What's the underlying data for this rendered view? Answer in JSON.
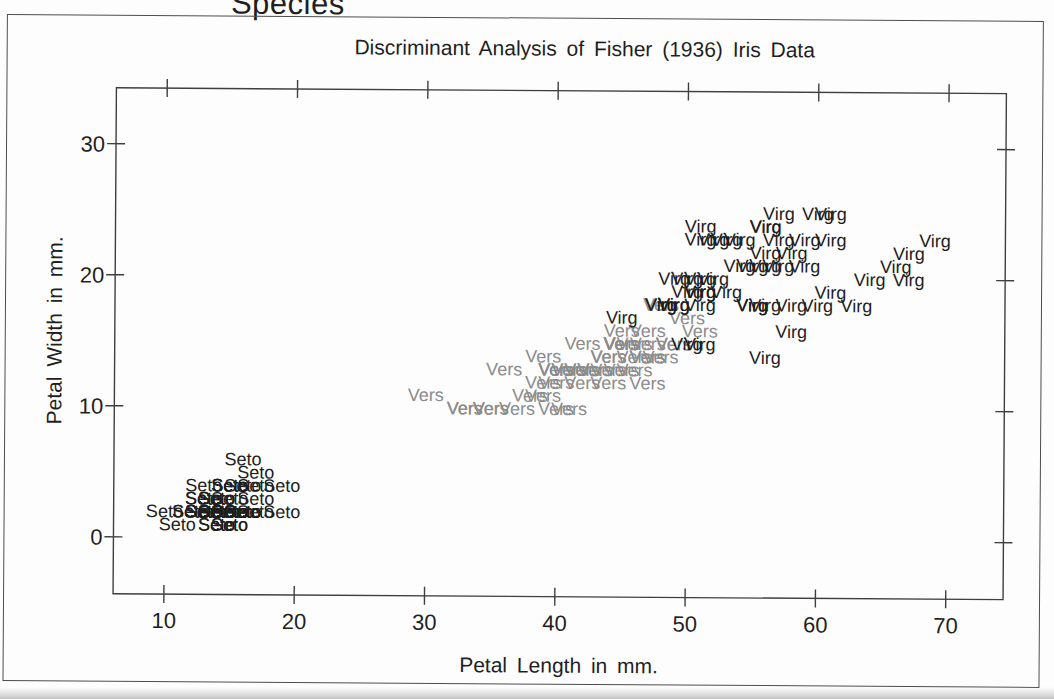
{
  "chart_data": {
    "type": "scatter",
    "title": "Discriminant Analysis of Fisher (1936) Iris Data",
    "legend_title": "Species",
    "xlabel": "Petal Length in mm.",
    "ylabel": "Petal Width in mm.",
    "xlim": [
      6.1,
      74.4
    ],
    "ylim": [
      -4.35,
      34.27
    ],
    "xticks": [
      10,
      20,
      30,
      40,
      50,
      60,
      70
    ],
    "yticks": [
      0,
      10,
      20,
      30
    ],
    "grid": false,
    "marker_style": "species-text-label-at-each-observation",
    "frame_color": "#3f3f3f",
    "series": [
      {
        "label": "Seto",
        "color": "#1e1e1e",
        "points": [
          [
            14,
            2
          ],
          [
            14,
            2
          ],
          [
            13,
            2
          ],
          [
            15,
            2
          ],
          [
            14,
            2
          ],
          [
            17,
            4
          ],
          [
            14,
            3
          ],
          [
            15,
            2
          ],
          [
            14,
            2
          ],
          [
            15,
            1
          ],
          [
            15,
            2
          ],
          [
            16,
            2
          ],
          [
            14,
            1
          ],
          [
            11,
            1
          ],
          [
            12,
            2
          ],
          [
            15,
            4
          ],
          [
            13,
            4
          ],
          [
            14,
            3
          ],
          [
            17,
            3
          ],
          [
            15,
            3
          ],
          [
            17,
            2
          ],
          [
            15,
            4
          ],
          [
            10,
            2
          ],
          [
            17,
            5
          ],
          [
            19,
            2
          ],
          [
            16,
            2
          ],
          [
            16,
            4
          ],
          [
            15,
            2
          ],
          [
            14,
            2
          ],
          [
            16,
            2
          ],
          [
            16,
            2
          ],
          [
            15,
            4
          ],
          [
            15,
            1
          ],
          [
            14,
            2
          ],
          [
            15,
            2
          ],
          [
            12,
            2
          ],
          [
            13,
            2
          ],
          [
            14,
            1
          ],
          [
            13,
            2
          ],
          [
            15,
            2
          ],
          [
            13,
            3
          ],
          [
            13,
            3
          ],
          [
            13,
            2
          ],
          [
            16,
            6
          ],
          [
            19,
            4
          ],
          [
            14,
            3
          ],
          [
            16,
            2
          ],
          [
            14,
            2
          ],
          [
            15,
            2
          ],
          [
            14,
            2
          ]
        ]
      },
      {
        "label": "Vers",
        "color": "#8c8c8c",
        "points": [
          [
            47,
            14
          ],
          [
            45,
            15
          ],
          [
            49,
            15
          ],
          [
            40,
            13
          ],
          [
            46,
            15
          ],
          [
            45,
            13
          ],
          [
            47,
            16
          ],
          [
            33,
            10
          ],
          [
            46,
            13
          ],
          [
            39,
            14
          ],
          [
            35,
            10
          ],
          [
            42,
            15
          ],
          [
            40,
            10
          ],
          [
            47,
            14
          ],
          [
            36,
            13
          ],
          [
            44,
            14
          ],
          [
            45,
            15
          ],
          [
            41,
            10
          ],
          [
            45,
            15
          ],
          [
            39,
            11
          ],
          [
            48,
            18
          ],
          [
            40,
            13
          ],
          [
            49,
            15
          ],
          [
            47,
            12
          ],
          [
            43,
            13
          ],
          [
            44,
            14
          ],
          [
            48,
            14
          ],
          [
            50,
            17
          ],
          [
            45,
            15
          ],
          [
            35,
            10
          ],
          [
            38,
            11
          ],
          [
            37,
            10
          ],
          [
            39,
            12
          ],
          [
            51,
            16
          ],
          [
            45,
            15
          ],
          [
            45,
            16
          ],
          [
            47,
            15
          ],
          [
            44,
            13
          ],
          [
            41,
            13
          ],
          [
            40,
            13
          ],
          [
            44,
            12
          ],
          [
            46,
            14
          ],
          [
            40,
            12
          ],
          [
            33,
            10
          ],
          [
            42,
            13
          ],
          [
            42,
            12
          ],
          [
            42,
            13
          ],
          [
            43,
            13
          ],
          [
            30,
            11
          ],
          [
            41,
            13
          ]
        ]
      },
      {
        "label": "Virg",
        "color": "#1e1e1e",
        "points": [
          [
            60,
            25
          ],
          [
            51,
            19
          ],
          [
            59,
            21
          ],
          [
            56,
            18
          ],
          [
            58,
            22
          ],
          [
            66,
            21
          ],
          [
            45,
            17
          ],
          [
            63,
            18
          ],
          [
            58,
            18
          ],
          [
            61,
            25
          ],
          [
            51,
            20
          ],
          [
            53,
            19
          ],
          [
            55,
            21
          ],
          [
            50,
            20
          ],
          [
            51,
            24
          ],
          [
            53,
            23
          ],
          [
            55,
            18
          ],
          [
            67,
            22
          ],
          [
            69,
            23
          ],
          [
            50,
            15
          ],
          [
            57,
            23
          ],
          [
            49,
            20
          ],
          [
            67,
            20
          ],
          [
            49,
            18
          ],
          [
            57,
            21
          ],
          [
            60,
            18
          ],
          [
            48,
            18
          ],
          [
            49,
            18
          ],
          [
            56,
            21
          ],
          [
            58,
            16
          ],
          [
            61,
            19
          ],
          [
            64,
            20
          ],
          [
            56,
            22
          ],
          [
            51,
            15
          ],
          [
            56,
            14
          ],
          [
            61,
            23
          ],
          [
            56,
            24
          ],
          [
            55,
            18
          ],
          [
            48,
            18
          ],
          [
            54,
            21
          ],
          [
            56,
            24
          ],
          [
            51,
            23
          ],
          [
            51,
            19
          ],
          [
            59,
            23
          ],
          [
            57,
            25
          ],
          [
            52,
            23
          ],
          [
            50,
            19
          ],
          [
            52,
            20
          ],
          [
            54,
            23
          ],
          [
            51,
            18
          ]
        ]
      }
    ]
  }
}
